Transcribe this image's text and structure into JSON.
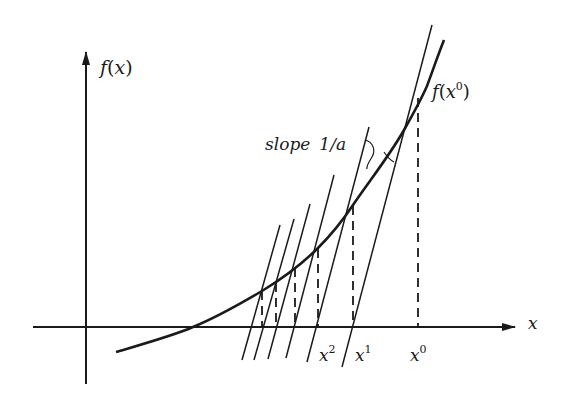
{
  "figure": {
    "colors": {
      "ink": "#1a1a1a",
      "background": "#ffffff"
    },
    "axes": {
      "y_label_f": "f",
      "y_label_open": "(",
      "y_label_var": "x",
      "y_label_close": ")",
      "x_label": "x"
    },
    "annotations": {
      "slope_word": "slope",
      "slope_value": "1/a",
      "f_x0_f": "f",
      "f_x0_open": "(",
      "f_x0_var": "x",
      "f_x0_sup": "0",
      "f_x0_close": ")"
    },
    "iterates": [
      {
        "base": "x",
        "sup": "0"
      },
      {
        "base": "x",
        "sup": "1"
      },
      {
        "base": "x",
        "sup": "2"
      }
    ]
  }
}
